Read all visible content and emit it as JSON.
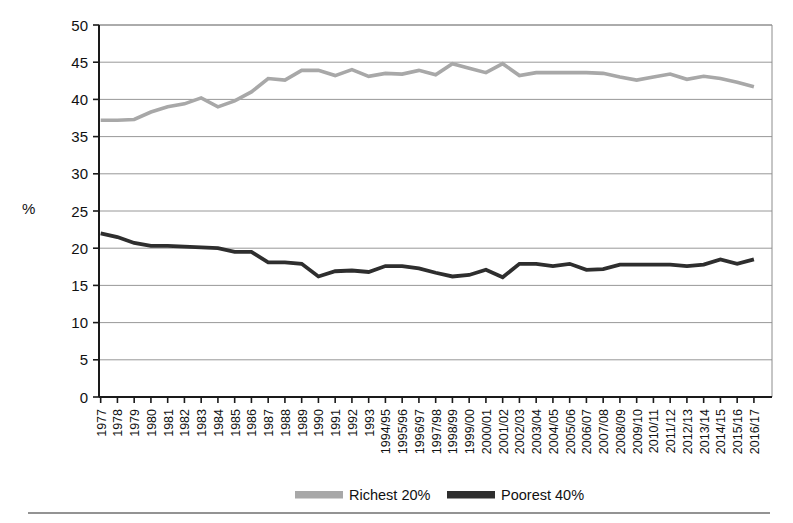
{
  "chart_data": {
    "type": "line",
    "title": "",
    "xlabel": "",
    "ylabel": "%",
    "ylim": [
      0,
      50
    ],
    "ytick_step": 5,
    "yticks": [
      "0",
      "5",
      "10",
      "15",
      "20",
      "25",
      "30",
      "35",
      "40",
      "45",
      "50"
    ],
    "grid": true,
    "legend_position": "bottom",
    "categories": [
      "1977",
      "1978",
      "1979",
      "1980",
      "1981",
      "1982",
      "1983",
      "1984",
      "1985",
      "1986",
      "1987",
      "1988",
      "1989",
      "1990",
      "1991",
      "1992",
      "1993",
      "1994/95",
      "1995/96",
      "1996/97",
      "1997/98",
      "1998/99",
      "1999/00",
      "2000/01",
      "2001/02",
      "2002/03",
      "2003/04",
      "2004/05",
      "2005/06",
      "2006/07",
      "2007/08",
      "2008/09",
      "2009/10",
      "2010/11",
      "2011/12",
      "2012/13",
      "2013/14",
      "2014/15",
      "2015/16",
      "2016/17"
    ],
    "series": [
      {
        "name": "Richest 20%",
        "color": "#a8a8a8",
        "values": [
          37.2,
          37.2,
          37.3,
          38.3,
          39.0,
          39.4,
          40.2,
          39.0,
          39.8,
          41.0,
          42.8,
          42.6,
          43.9,
          43.9,
          43.2,
          44.0,
          43.1,
          43.5,
          43.4,
          43.9,
          43.3,
          44.8,
          44.2,
          43.6,
          44.8,
          43.2,
          43.6,
          43.6,
          43.6,
          43.6,
          43.5,
          43.0,
          42.6,
          43.0,
          43.4,
          42.7,
          43.1,
          42.8,
          42.3,
          41.7
        ]
      },
      {
        "name": "Poorest 40%",
        "color": "#2e2e2e",
        "values": [
          22.0,
          21.5,
          20.7,
          20.3,
          20.3,
          20.2,
          20.1,
          20.0,
          19.5,
          19.5,
          18.1,
          18.1,
          17.9,
          16.2,
          16.9,
          17.0,
          16.8,
          17.6,
          17.6,
          17.3,
          16.7,
          16.2,
          16.4,
          17.1,
          16.1,
          17.9,
          17.9,
          17.6,
          17.9,
          17.1,
          17.2,
          17.8,
          17.8,
          17.8,
          17.8,
          17.6,
          17.8,
          18.5,
          17.9,
          18.5
        ]
      }
    ],
    "legend": [
      {
        "label": "Richest 20%",
        "color": "#a8a8a8"
      },
      {
        "label": "Poorest 40%",
        "color": "#2e2e2e"
      }
    ]
  }
}
